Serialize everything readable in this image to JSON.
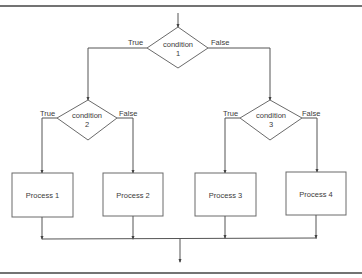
{
  "diagram": {
    "type": "flowchart",
    "colors": {
      "stroke": "#555555",
      "text": "#3a3a3a",
      "background": "#ffffff"
    },
    "decisions": [
      {
        "id": "condition1",
        "label": "condition",
        "number": "1",
        "true_label": "True",
        "false_label": "False"
      },
      {
        "id": "condition2",
        "label": "condition",
        "number": "2",
        "true_label": "True",
        "false_label": "False"
      },
      {
        "id": "condition3",
        "label": "condition",
        "number": "3",
        "true_label": "True",
        "false_label": "False"
      }
    ],
    "processes": [
      {
        "id": "process1",
        "label": "Process 1"
      },
      {
        "id": "process2",
        "label": "Process 2"
      },
      {
        "id": "process3",
        "label": "Process 3"
      },
      {
        "id": "process4",
        "label": "Process 4"
      }
    ],
    "edges": [
      {
        "from": "start",
        "to": "condition1"
      },
      {
        "from": "condition1",
        "to": "condition2",
        "label": "True"
      },
      {
        "from": "condition1",
        "to": "condition3",
        "label": "False"
      },
      {
        "from": "condition2",
        "to": "process1",
        "label": "True"
      },
      {
        "from": "condition2",
        "to": "process2",
        "label": "False"
      },
      {
        "from": "condition3",
        "to": "process3",
        "label": "True"
      },
      {
        "from": "condition3",
        "to": "process4",
        "label": "False"
      },
      {
        "from": "process1",
        "to": "end"
      },
      {
        "from": "process2",
        "to": "end"
      },
      {
        "from": "process3",
        "to": "end"
      },
      {
        "from": "process4",
        "to": "end"
      }
    ]
  }
}
